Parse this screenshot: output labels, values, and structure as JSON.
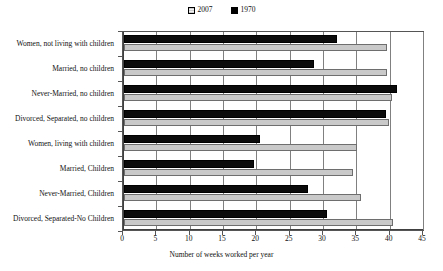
{
  "chart_data": {
    "type": "bar",
    "orientation": "horizontal",
    "title": "",
    "xlabel": "Number of weeks worked per year",
    "ylabel": "",
    "xlim": [
      0,
      45
    ],
    "xticks": [
      0,
      5,
      10,
      15,
      20,
      25,
      30,
      35,
      40,
      45
    ],
    "grid": "vertical",
    "legend_position": "top-center",
    "categories": [
      "Women, not living with children",
      "Married, no children",
      "Never-Married, no children",
      "Divorced, Separated, no children",
      "Women, living with children",
      "Married, Children",
      "Never-Married, Children",
      "Divorced, Separated-No Children"
    ],
    "series": [
      {
        "name": "2007",
        "color": "#c9c9c9",
        "values": [
          39.5,
          39.4,
          40.2,
          39.8,
          35.0,
          34.3,
          35.6,
          40.3
        ]
      },
      {
        "name": "1970",
        "color": "#000000",
        "values": [
          32.0,
          28.5,
          41.0,
          39.3,
          20.4,
          19.5,
          27.6,
          30.4
        ]
      }
    ]
  },
  "legend": {
    "entries": [
      {
        "label": "2007",
        "swatch": "swatch-2007-gray"
      },
      {
        "label": "1970",
        "swatch": "swatch-1970-black"
      }
    ]
  },
  "axis": {
    "x_title": "Number of weeks worked per year"
  }
}
